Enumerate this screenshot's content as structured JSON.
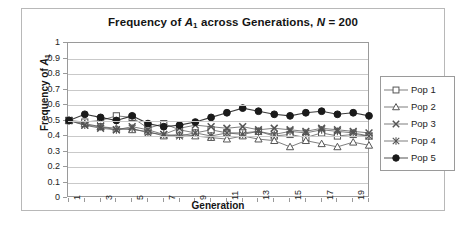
{
  "chart_data": {
    "type": "line",
    "title": "Frequency of A1 across Generations, N = 200",
    "title_parts": {
      "pre": "Frequency of ",
      "italic1": "A",
      "sub1": "1",
      "mid": " across Generations, ",
      "italic2": "N",
      "post": " = 200"
    },
    "xlabel": "Generation",
    "ylabel": "Frequency of A1",
    "ylabel_parts": {
      "pre": "Frequency of ",
      "italic": "A",
      "sub": "1"
    },
    "x": [
      1,
      2,
      3,
      4,
      5,
      6,
      7,
      8,
      9,
      10,
      11,
      12,
      13,
      14,
      15,
      16,
      17,
      18,
      19,
      20
    ],
    "xlim": [
      1,
      20
    ],
    "ylim": [
      0,
      1
    ],
    "yticks": [
      "0",
      "0.1",
      "0.2",
      "0.3",
      "0.4",
      "0.5",
      "0.6",
      "0.7",
      "0.8",
      "0.9",
      "1"
    ],
    "ytick_values": [
      0,
      0.1,
      0.2,
      0.3,
      0.4,
      0.5,
      0.6,
      0.7,
      0.8,
      0.9,
      1
    ],
    "xtick_labels": [
      "1",
      "3",
      "5",
      "7",
      "9",
      "11",
      "13",
      "15",
      "17",
      "19"
    ],
    "xtick_values": [
      1,
      3,
      5,
      7,
      9,
      11,
      13,
      15,
      17,
      19
    ],
    "grid": "horizontal",
    "legend_position": "right",
    "series": [
      {
        "name": "Pop 1",
        "marker": "open-square",
        "color": "#555555",
        "values": [
          0.5,
          0.49,
          0.5,
          0.53,
          0.52,
          0.45,
          0.48,
          0.44,
          0.42,
          0.44,
          0.42,
          0.42,
          0.43,
          0.4,
          0.41,
          0.39,
          0.42,
          0.4,
          0.41,
          0.4
        ]
      },
      {
        "name": "Pop 2",
        "marker": "open-triangle",
        "color": "#555555",
        "values": [
          0.5,
          0.48,
          0.46,
          0.45,
          0.44,
          0.43,
          0.4,
          0.41,
          0.4,
          0.39,
          0.38,
          0.4,
          0.38,
          0.37,
          0.33,
          0.37,
          0.35,
          0.33,
          0.36,
          0.34
        ]
      },
      {
        "name": "Pop 3",
        "marker": "cross-x",
        "color": "#555555",
        "values": [
          0.5,
          0.47,
          0.45,
          0.44,
          0.46,
          0.44,
          0.41,
          0.45,
          0.47,
          0.46,
          0.45,
          0.46,
          0.44,
          0.45,
          0.44,
          0.43,
          0.45,
          0.44,
          0.43,
          0.42
        ]
      },
      {
        "name": "Pop 4",
        "marker": "asterisk",
        "color": "#555555",
        "values": [
          0.5,
          0.47,
          0.46,
          0.44,
          0.45,
          0.42,
          0.41,
          0.4,
          0.42,
          0.4,
          0.42,
          0.41,
          0.43,
          0.41,
          0.43,
          0.42,
          0.44,
          0.43,
          0.42,
          0.4
        ]
      },
      {
        "name": "Pop 5",
        "marker": "filled-circle",
        "color": "#1a1a1a",
        "values": [
          0.5,
          0.54,
          0.52,
          0.5,
          0.53,
          0.48,
          0.46,
          0.47,
          0.49,
          0.52,
          0.55,
          0.58,
          0.56,
          0.54,
          0.53,
          0.55,
          0.56,
          0.54,
          0.55,
          0.53
        ]
      }
    ]
  },
  "legend": {
    "items": [
      {
        "label": "Pop 1"
      },
      {
        "label": "Pop 2"
      },
      {
        "label": "Pop 3"
      },
      {
        "label": "Pop 4"
      },
      {
        "label": "Pop 5"
      }
    ]
  }
}
